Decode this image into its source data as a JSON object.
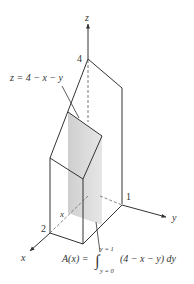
{
  "figure": {
    "axes": {
      "x_label": "x",
      "y_label": "y",
      "z_label": "z"
    },
    "ticks": {
      "z_top": "4",
      "x_end": "2",
      "y_end": "1",
      "slice_x": "x"
    },
    "surface_label": "z = 4 − x − y",
    "formula": {
      "lhs": "A(x) =",
      "upper_limit": "y = 1",
      "lower_limit": "y = 0",
      "integrand": "(4 − x − y) dy"
    },
    "colors": {
      "line": "#333333",
      "shade": "#d9d9d9"
    }
  }
}
